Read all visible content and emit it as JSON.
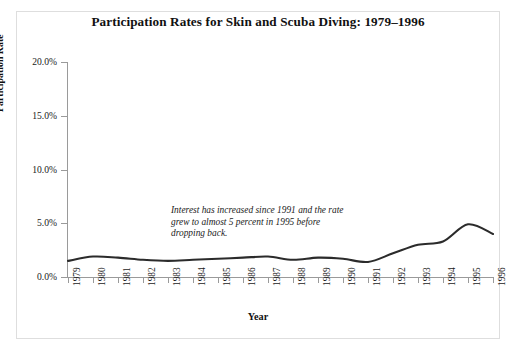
{
  "figure": {
    "title": "Participation Rates for Skin and Scuba Diving: 1979–1996",
    "annotation_lines": [
      "Interest has increased since 1991 and the rate",
      "grew to almost 5 percent in 1995 before",
      "dropping back."
    ],
    "line_color": "#2b2b2b",
    "axis_color": "#9a9a9a",
    "border_color": "#dedede",
    "background": "#ffffff"
  },
  "chart_data": {
    "type": "line",
    "title": "Participation Rates for Skin and Scuba Diving: 1979–1996",
    "xlabel": "Year",
    "ylabel": "Participation Rate",
    "categories": [
      "1979",
      "1980",
      "1981",
      "1982",
      "1983",
      "1984",
      "1985",
      "1986",
      "1987",
      "1988",
      "1989",
      "1990",
      "1991",
      "1992",
      "1993",
      "1994",
      "1995",
      "1996"
    ],
    "values": [
      1.5,
      1.9,
      1.8,
      1.6,
      1.5,
      1.6,
      1.7,
      1.8,
      1.9,
      1.6,
      1.8,
      1.7,
      1.4,
      2.2,
      3.0,
      3.3,
      4.9,
      4.0
    ],
    "series": [
      {
        "name": "Participation Rate",
        "values": [
          1.5,
          1.9,
          1.8,
          1.6,
          1.5,
          1.6,
          1.7,
          1.8,
          1.9,
          1.6,
          1.8,
          1.7,
          1.4,
          2.2,
          3.0,
          3.3,
          4.9,
          4.0
        ]
      }
    ],
    "ylim": [
      0,
      20
    ],
    "ytick_values": [
      0,
      5,
      10,
      15,
      20
    ],
    "ytick_labels": [
      "0.0%",
      "5.0%",
      "10.0%",
      "15.0%",
      "20.0%"
    ],
    "grid": false,
    "legend": "none",
    "value_unit": "percent",
    "smoothing": "spline",
    "annotations": [
      {
        "text": "Interest has increased since 1991 and the rate grew to almost 5 percent in 1995 before dropping back.",
        "style": "italic"
      }
    ]
  }
}
